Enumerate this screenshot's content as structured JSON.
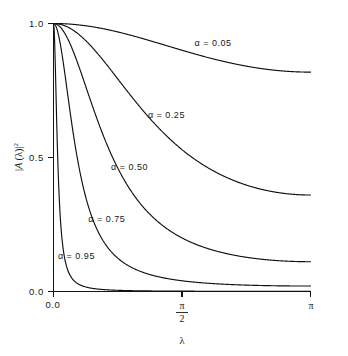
{
  "figure": {
    "background_color": "#ffffff",
    "line_color": "#101010"
  },
  "axes": {
    "x_title": "λ",
    "y_title": "|A (λ)|²",
    "y_title_parts": {
      "bar_left": "|",
      "a": "A",
      "lparen": "(",
      "lambda": "λ",
      "rparen": ")",
      "bar_right": "|",
      "exponent": "2"
    },
    "x_ticklabels": [
      "0.0",
      "π/2",
      "π"
    ],
    "x_tick_pi_over_2": {
      "numerator": "π",
      "denominator": "2"
    },
    "x_tick_pi": "π",
    "y_ticklabels": [
      "0.0",
      "0.5",
      "1.0"
    ]
  },
  "chart_data": {
    "type": "line",
    "title": "",
    "xlabel": "λ",
    "ylabel": "|A (λ)|²",
    "xlim": [
      0,
      3.14159265
    ],
    "ylim": [
      0.0,
      1.0
    ],
    "xticks": [
      0,
      1.5707963,
      3.14159265
    ],
    "xticklabels": [
      "0.0",
      "π/2",
      "π"
    ],
    "yticks": [
      0.0,
      0.5,
      1.0
    ],
    "yticklabels": [
      "0.0",
      "0.5",
      "1.0"
    ],
    "grid": false,
    "legend": "inline-annotations",
    "x": [
      0.0,
      0.0628,
      0.1257,
      0.1885,
      0.2513,
      0.3142,
      0.377,
      0.4398,
      0.5027,
      0.5655,
      0.6283,
      0.6912,
      0.754,
      0.8168,
      0.8796,
      0.9425,
      1.0053,
      1.0681,
      1.131,
      1.1938,
      1.2566,
      1.3195,
      1.3823,
      1.4451,
      1.508,
      1.5708,
      1.6336,
      1.6965,
      1.7593,
      1.8221,
      1.885,
      1.9478,
      2.0106,
      2.0735,
      2.1363,
      2.1991,
      2.2619,
      2.3248,
      2.3876,
      2.4504,
      2.5133,
      2.5761,
      2.6389,
      2.7018,
      2.7646,
      2.8274,
      2.8903,
      2.9531,
      3.0159,
      3.0788,
      3.1416
    ],
    "series": [
      {
        "name": "α = 0.05",
        "alpha": 0.05,
        "label": "α = 0.05",
        "label_x": 1.95,
        "label_y": 0.915,
        "endpoint_value": 0.819,
        "values": [
          1.0,
          1.0,
          0.9999,
          0.9998,
          0.9996,
          0.9994,
          0.9991,
          0.9988,
          0.9984,
          0.9979,
          0.9974,
          0.9968,
          0.9961,
          0.9954,
          0.9946,
          0.9937,
          0.9927,
          0.9917,
          0.9906,
          0.9894,
          0.9881,
          0.9867,
          0.9853,
          0.9837,
          0.9821,
          0.9804,
          0.9786,
          0.9768,
          0.9748,
          0.9728,
          0.9707,
          0.9685,
          0.9662,
          0.9638,
          0.9614,
          0.9589,
          0.9563,
          0.9536,
          0.9509,
          0.9481,
          0.9452,
          0.9423,
          0.9393,
          0.9363,
          0.9332,
          0.93,
          0.9268,
          0.9236,
          0.9203,
          0.917,
          0.819
        ]
      },
      {
        "name": "α = 0.25",
        "alpha": 0.25,
        "label": "α = 0.25",
        "label_x": 1.38,
        "label_y": 0.648,
        "endpoint_value": 0.36,
        "values": [
          1.0,
          0.9993,
          0.9972,
          0.9937,
          0.9889,
          0.9827,
          0.9753,
          0.9666,
          0.9567,
          0.9457,
          0.9336,
          0.9206,
          0.9066,
          0.8918,
          0.8763,
          0.8601,
          0.8433,
          0.826,
          0.8083,
          0.7903,
          0.772,
          0.7535,
          0.7349,
          0.7163,
          0.6976,
          0.679,
          0.6606,
          0.6423,
          0.6242,
          0.6064,
          0.589,
          0.5718,
          0.5551,
          0.5387,
          0.5228,
          0.5074,
          0.4924,
          0.4779,
          0.4639,
          0.4505,
          0.4375,
          0.4251,
          0.4133,
          0.402,
          0.3913,
          0.3811,
          0.3715,
          0.3625,
          0.3541,
          0.3462,
          0.36
        ]
      },
      {
        "name": "α = 0.50",
        "alpha": 0.5,
        "label": "α = 0.50",
        "label_x": 0.93,
        "label_y": 0.455,
        "endpoint_value": 0.111,
        "values": [
          1.0,
          0.9969,
          0.9877,
          0.9728,
          0.9526,
          0.9276,
          0.8986,
          0.8663,
          0.8315,
          0.795,
          0.7575,
          0.7197,
          0.6821,
          0.6452,
          0.6093,
          0.5748,
          0.5419,
          0.5107,
          0.4813,
          0.4538,
          0.4282,
          0.4044,
          0.3824,
          0.3622,
          0.3436,
          0.3266,
          0.3111,
          0.2969,
          0.2841,
          0.2724,
          0.2619,
          0.2524,
          0.2438,
          0.2362,
          0.2294,
          0.2234,
          0.2181,
          0.2135,
          0.2095,
          0.2061,
          0.2032,
          0.2008,
          0.1989,
          0.1974,
          0.1963,
          0.1956,
          0.1951,
          0.195,
          0.1951,
          0.1953,
          0.111
        ]
      },
      {
        "name": "α = 0.75",
        "alpha": 0.75,
        "label": "α = 0.75",
        "label_x": 0.65,
        "label_y": 0.258,
        "endpoint_value": 0.02,
        "values": [
          1.0,
          0.9855,
          0.944,
          0.8817,
          0.8063,
          0.7254,
          0.645,
          0.5693,
          0.5007,
          0.44,
          0.3873,
          0.3419,
          0.3031,
          0.27,
          0.2418,
          0.2178,
          0.1974,
          0.18,
          0.1651,
          0.1524,
          0.1415,
          0.1322,
          0.1242,
          0.1173,
          0.1114,
          0.1063,
          0.102,
          0.0982,
          0.095,
          0.0923,
          0.0899,
          0.0879,
          0.0862,
          0.0847,
          0.0835,
          0.0825,
          0.0816,
          0.0809,
          0.0803,
          0.0798,
          0.0794,
          0.0791,
          0.0789,
          0.0788,
          0.0787,
          0.0786,
          0.0786,
          0.0786,
          0.0786,
          0.0786,
          0.02
        ]
      },
      {
        "name": "α = 0.95",
        "alpha": 0.95,
        "label": "α = 0.95",
        "label_x": 0.28,
        "label_y": 0.12,
        "endpoint_value": 0.0007,
        "values": [
          1.0,
          0.8164,
          0.5292,
          0.3349,
          0.2192,
          0.15,
          0.1073,
          0.08,
          0.0619,
          0.0494,
          0.0405,
          0.034,
          0.0291,
          0.0253,
          0.0223,
          0.0199,
          0.018,
          0.0164,
          0.0151,
          0.014,
          0.0131,
          0.0123,
          0.0116,
          0.011,
          0.0105,
          0.0101,
          0.0097,
          0.0094,
          0.0091,
          0.0089,
          0.0087,
          0.0085,
          0.0083,
          0.0082,
          0.0081,
          0.008,
          0.0079,
          0.0078,
          0.0078,
          0.0077,
          0.0077,
          0.0077,
          0.0076,
          0.0076,
          0.0076,
          0.0076,
          0.0076,
          0.0076,
          0.0076,
          0.0076,
          0.0007
        ]
      }
    ]
  }
}
